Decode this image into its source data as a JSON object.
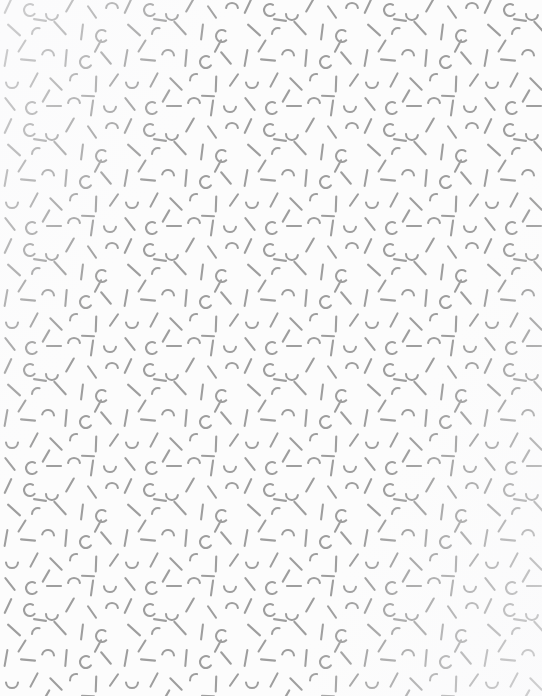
{
  "canvas": {
    "width": 542,
    "height": 696,
    "background_color": "#fcfcfc",
    "description": "Seamless decorative memphis-style confetti texture of small gray strokes and arcs"
  },
  "pattern": {
    "name": "memphis-squiggle-confetti",
    "tile_width": 120,
    "tile_height": 120,
    "stroke_color": "#9e9e9e",
    "stroke_width": 2.1,
    "stroke_linecap": "round",
    "shape_count_per_tile": 34,
    "shape_kinds": [
      "line-vertical",
      "line-horizontal",
      "line-diagonal-right",
      "line-diagonal-left",
      "arc-quarter",
      "arc-c-shape",
      "arc-u-smile",
      "arc-n-hook"
    ],
    "shapes": [
      {
        "kind": "line-diagonal-left",
        "x": 8,
        "y": 6,
        "len": 15,
        "angle": 115
      },
      {
        "kind": "arc-c-shape",
        "x": 30,
        "y": 10,
        "r": 6,
        "a0": 40,
        "a1": 300
      },
      {
        "kind": "arc-u-smile",
        "x": 52,
        "y": 14,
        "r": 6,
        "a0": 10,
        "a1": 180
      },
      {
        "kind": "line-diagonal-left",
        "x": 70,
        "y": 5,
        "len": 15,
        "angle": 120
      },
      {
        "kind": "line-diagonal-right",
        "x": 92,
        "y": 12,
        "len": 14,
        "angle": 55
      },
      {
        "kind": "arc-n-hook",
        "x": 112,
        "y": 9,
        "r": 6,
        "a0": 190,
        "a1": 350
      },
      {
        "kind": "line-diagonal-right",
        "x": 14,
        "y": 30,
        "len": 16,
        "angle": 42
      },
      {
        "kind": "arc-quarter",
        "x": 38,
        "y": 34,
        "r": 6,
        "a0": 180,
        "a1": 285
      },
      {
        "kind": "line-diagonal-right",
        "x": 60,
        "y": 28,
        "len": 17,
        "angle": 48
      },
      {
        "kind": "line-vertical",
        "x": 82,
        "y": 32,
        "len": 15,
        "angle": 97
      },
      {
        "kind": "arc-c-shape",
        "x": 102,
        "y": 36,
        "r": 6,
        "a0": 45,
        "a1": 305
      },
      {
        "kind": "line-vertical",
        "x": 6,
        "y": 58,
        "len": 16,
        "angle": 100
      },
      {
        "kind": "line-horizontal",
        "x": 28,
        "y": 60,
        "len": 14,
        "angle": 5
      },
      {
        "kind": "arc-n-hook",
        "x": 48,
        "y": 56,
        "r": 6,
        "a0": 195,
        "a1": 355
      },
      {
        "kind": "line-vertical",
        "x": 66,
        "y": 58,
        "len": 16,
        "angle": 95
      },
      {
        "kind": "arc-c-shape",
        "x": 86,
        "y": 62,
        "r": 6,
        "a0": 35,
        "a1": 300
      },
      {
        "kind": "line-diagonal-right",
        "x": 106,
        "y": 58,
        "len": 15,
        "angle": 50
      },
      {
        "kind": "arc-u-smile",
        "x": 12,
        "y": 82,
        "r": 6,
        "a0": 5,
        "a1": 175
      },
      {
        "kind": "line-diagonal-left",
        "x": 34,
        "y": 80,
        "len": 15,
        "angle": 118
      },
      {
        "kind": "line-diagonal-right",
        "x": 56,
        "y": 84,
        "len": 16,
        "angle": 45
      },
      {
        "kind": "arc-quarter",
        "x": 76,
        "y": 80,
        "r": 6,
        "a0": 175,
        "a1": 280
      },
      {
        "kind": "line-vertical",
        "x": 96,
        "y": 84,
        "len": 15,
        "angle": 92
      },
      {
        "kind": "line-diagonal-left",
        "x": 114,
        "y": 80,
        "len": 14,
        "angle": 125
      },
      {
        "kind": "line-diagonal-right",
        "x": 10,
        "y": 104,
        "len": 15,
        "angle": 52
      },
      {
        "kind": "arc-c-shape",
        "x": 32,
        "y": 108,
        "r": 6,
        "a0": 40,
        "a1": 300
      },
      {
        "kind": "line-horizontal",
        "x": 54,
        "y": 106,
        "len": 14,
        "angle": 0
      },
      {
        "kind": "arc-n-hook",
        "x": 74,
        "y": 104,
        "r": 6,
        "a0": 190,
        "a1": 350
      },
      {
        "kind": "line-vertical",
        "x": 92,
        "y": 108,
        "len": 15,
        "angle": 98
      },
      {
        "kind": "arc-u-smile",
        "x": 110,
        "y": 106,
        "r": 6,
        "a0": 8,
        "a1": 178
      },
      {
        "kind": "line-diagonal-left",
        "x": 22,
        "y": 46,
        "len": 13,
        "angle": 122
      },
      {
        "kind": "line-diagonal-left",
        "x": 98,
        "y": 46,
        "len": 13,
        "angle": 118
      },
      {
        "kind": "line-diagonal-left",
        "x": 46,
        "y": 96,
        "len": 13,
        "angle": 120
      },
      {
        "kind": "line-horizontal",
        "x": 40,
        "y": 20,
        "len": 12,
        "angle": 8
      },
      {
        "kind": "line-horizontal",
        "x": 88,
        "y": 96,
        "len": 12,
        "angle": 3
      }
    ]
  }
}
